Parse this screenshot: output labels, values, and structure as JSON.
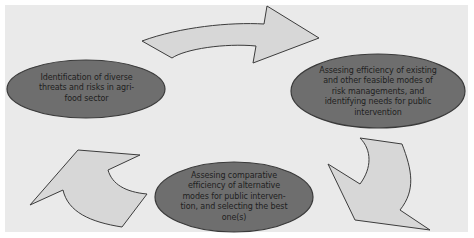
{
  "diagram": {
    "type": "cycle",
    "colors": {
      "background": "#eaeaea",
      "node_fill": "#6e6e6e",
      "node_stroke": "#3a3a3a",
      "arrow_fill": "#d7d7d7",
      "arrow_stroke": "#3c3c3c",
      "text": "#1e1e1e"
    },
    "nodes": [
      {
        "id": "identification",
        "text": "Identification of diverse threats and risks in agri-food sector",
        "lines": [
          "Identification of diverse",
          "threats and risks in agri-",
          "food sector"
        ]
      },
      {
        "id": "assessing-efficiency",
        "text": "Assesing efficiency of existing and other feasible modes of risk managements, and identifying needs for public intervention",
        "lines": [
          "Assesing efficiency of existing",
          "and other feasible modes of",
          "risk managements, and",
          "identifying needs for public",
          "intervention"
        ]
      },
      {
        "id": "assessing-comparative",
        "text": "Assesing comparative efficiency of alternative modes for public intervention, and selecting the best one(s)",
        "lines": [
          "Assesing comparative",
          "efficiency of alternative",
          "modes for public interven-",
          "tion, and selecting the best",
          "one(s)"
        ]
      }
    ],
    "edges": [
      {
        "from": "identification",
        "to": "assessing-efficiency",
        "icon": "curved-arrow-right-icon"
      },
      {
        "from": "assessing-efficiency",
        "to": "assessing-comparative",
        "icon": "curved-arrow-down-icon"
      },
      {
        "from": "assessing-comparative",
        "to": "identification",
        "icon": "curved-arrow-up-icon"
      }
    ]
  }
}
